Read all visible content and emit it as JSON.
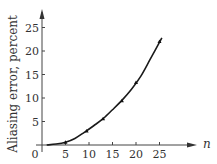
{
  "chart_data": {
    "type": "line",
    "title": "",
    "xlabel": "n",
    "ylabel": "Aliasing error, percent",
    "xlim": [
      0,
      33
    ],
    "ylim": [
      0,
      28
    ],
    "x_ticks": [
      5,
      10,
      15,
      20,
      25
    ],
    "y_ticks": [
      5,
      10,
      15,
      20,
      25
    ],
    "origin_label": "0",
    "grid": false,
    "legend": null,
    "series": [
      {
        "name": "Aliasing error",
        "style": "smooth curve",
        "x": [
          1,
          3,
          5,
          7,
          9,
          11,
          13,
          15,
          17,
          19,
          21,
          23,
          25.5
        ],
        "values": [
          0,
          0.2,
          0.6,
          1.4,
          2.7,
          4.1,
          5.6,
          7.5,
          9.5,
          11.8,
          14.6,
          18.2,
          22.8
        ]
      },
      {
        "name": "Measured points",
        "style": "markers",
        "x": [
          5,
          9.5,
          13,
          17,
          20,
          25
        ],
        "values": [
          0.6,
          3.0,
          5.6,
          9.4,
          13.3,
          22.0
        ]
      }
    ]
  }
}
